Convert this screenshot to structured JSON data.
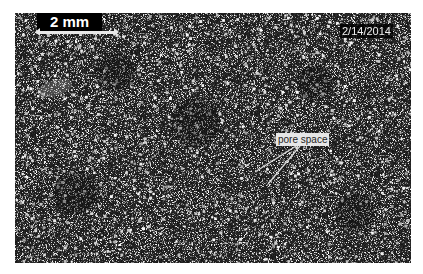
{
  "image": {
    "description": "Grayscale thin-section micrograph showing grains and pore space",
    "colors": {
      "background": "#1a1a1a",
      "grain": "#ffffff",
      "annotation_bg": "#e6e6e6"
    }
  },
  "scale_bar": {
    "label": "2 mm"
  },
  "date_stamp": "2/14/2014",
  "annotation": {
    "label": "pore space"
  }
}
